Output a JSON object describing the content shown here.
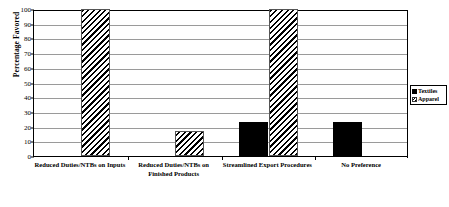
{
  "chart_data": {
    "type": "bar",
    "title": "",
    "subtitle": "",
    "xlabel": "",
    "ylabel": "Percentage Favored",
    "ylim": [
      0,
      100
    ],
    "ytick_step": 10,
    "yticks": [
      0,
      10,
      20,
      30,
      40,
      50,
      60,
      70,
      80,
      90,
      100
    ],
    "grid": true,
    "legend_position": "right-outside",
    "categories": [
      "Reduced Duties/NTBs on Inputs",
      "Reduced Duties/NTBs on Finished Products",
      "Streamlined Export Procedures",
      "No Preference"
    ],
    "series": [
      {
        "name": "Textiles",
        "fill": "solid-black",
        "color": "#000000",
        "values": [
          0,
          0,
          23,
          23
        ]
      },
      {
        "name": "Apparel",
        "fill": "diagonal-hatch",
        "color": "#000000",
        "values": [
          100,
          17,
          100,
          0
        ]
      }
    ]
  },
  "legend": {
    "items": [
      {
        "label": "Textiles"
      },
      {
        "label": "Apparel"
      }
    ]
  },
  "axis": {
    "y_title": "Percentage Favored",
    "tick_labels": [
      "100",
      "90",
      "80",
      "70",
      "60",
      "50",
      "40",
      "30",
      "20",
      "10",
      "0"
    ]
  }
}
